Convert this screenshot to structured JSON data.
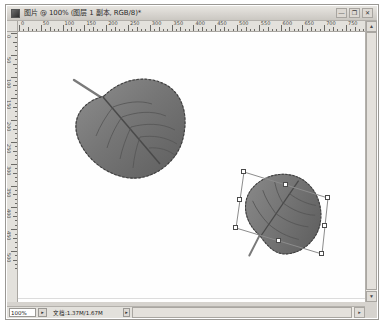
{
  "window": {
    "title": "图片 @ 100% (图层 1 副本, RGB/8)*",
    "doc_icon": "document-icon",
    "controls": {
      "minimize": "—",
      "maximize": "❐",
      "close": "✕"
    }
  },
  "rulers": {
    "unit": "px",
    "top_labels": [
      "0",
      "50",
      "100",
      "150",
      "200",
      "250",
      "300",
      "350",
      "400",
      "450",
      "500",
      "550",
      "600",
      "650",
      "700",
      "750"
    ],
    "left_labels": [
      "0",
      "50",
      "100",
      "150",
      "200",
      "250",
      "300",
      "350",
      "400",
      "450",
      "500"
    ]
  },
  "canvas": {
    "background": "#ffffff",
    "layers": [
      {
        "name": "leaf-large",
        "state": "unselected",
        "description": "grayscale serrated leaf with stem"
      },
      {
        "name": "leaf-copy",
        "state": "free-transform-selected",
        "description": "rotated duplicate leaf inside transform box",
        "rotation_deg": -18
      }
    ]
  },
  "transform": {
    "handles": [
      "top-left",
      "top-center",
      "top-right",
      "middle-right",
      "bottom-right",
      "bottom-center",
      "bottom-left",
      "middle-left"
    ],
    "box_color": "#8c8c8c",
    "handle_fill": "#ffffff",
    "handle_stroke": "#4a4a4a"
  },
  "status": {
    "zoom": "100%",
    "zoom_arrow": "▸",
    "doc_size": "文档:1.37M/1.67M",
    "more_arrow": "▸"
  },
  "scrollbars": {
    "vertical": {
      "up": "▲",
      "down": "▼"
    },
    "horizontal": {
      "left": "◂",
      "right": "▸"
    }
  }
}
